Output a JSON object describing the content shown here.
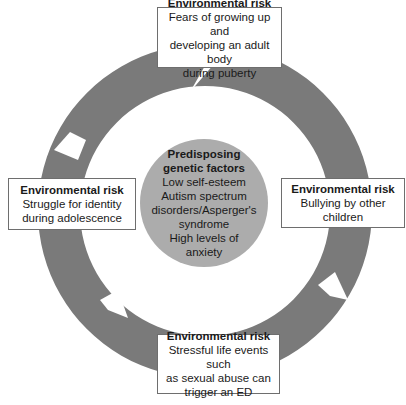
{
  "diagram": {
    "type": "cycle",
    "colors": {
      "ring": "#7a7a7a",
      "center_fill": "#acacac",
      "box_border": "#6e6e6e"
    },
    "center": {
      "title_lines": [
        "Predisposing",
        "genetic factors"
      ],
      "items": [
        "Low self-esteem",
        "Autism spectrum",
        "disorders/Asperger's",
        "syndrome",
        "High levels of",
        "anxiety"
      ]
    },
    "boxes": [
      {
        "position": "top",
        "title": "Environmental risk",
        "lines": [
          "Fears of growing up and",
          "developing an adult body",
          "during puberty"
        ]
      },
      {
        "position": "right",
        "title": "Environmental risk",
        "lines": [
          "Bullying by other",
          "children"
        ]
      },
      {
        "position": "bottom",
        "title": "Environmental risk",
        "lines": [
          "Stressful life events such",
          "as sexual abuse can",
          "trigger an ED"
        ]
      },
      {
        "position": "left",
        "title": "Environmental risk",
        "lines": [
          "Struggle for identity",
          "during adolescence"
        ]
      }
    ]
  }
}
